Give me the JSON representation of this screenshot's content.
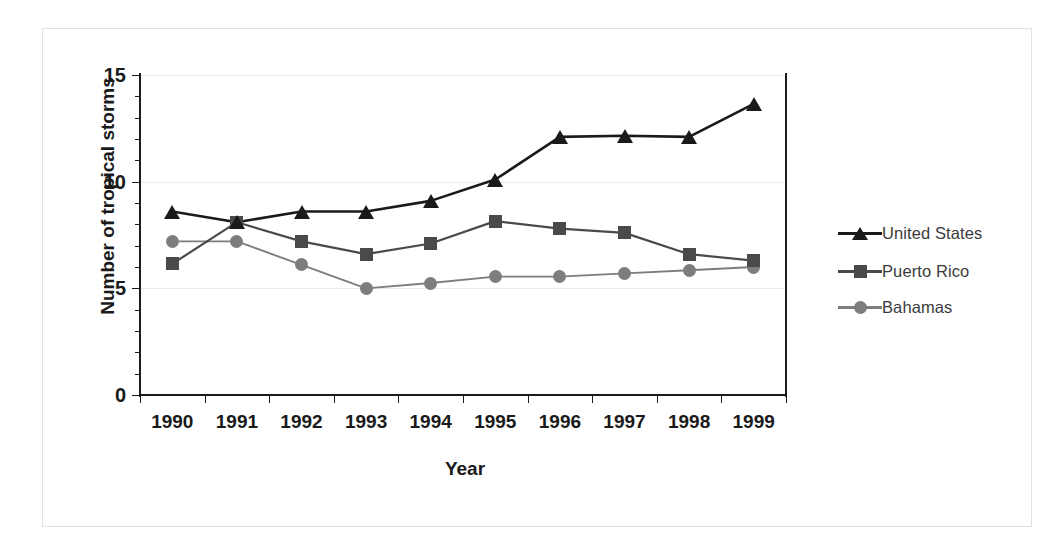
{
  "chart_data": {
    "type": "line",
    "title": "",
    "xlabel": "Year",
    "ylabel": "Number of tropical storms",
    "categories": [
      "1990",
      "1991",
      "1992",
      "1993",
      "1994",
      "1995",
      "1996",
      "1997",
      "1998",
      "1999"
    ],
    "ylim": [
      0,
      15
    ],
    "y_ticks": [
      0,
      5,
      10,
      15
    ],
    "y_tick_labels": [
      "0",
      "5",
      "10",
      "15"
    ],
    "grid": true,
    "grid_axis": "y",
    "grid_style": "dotted",
    "legend_position": "right",
    "series": [
      {
        "name": "United States",
        "marker": "triangle",
        "color": "#1a1a1a",
        "values": [
          8.6,
          8.1,
          8.6,
          8.6,
          9.1,
          10.1,
          12.1,
          12.15,
          12.1,
          13.65
        ]
      },
      {
        "name": "Puerto Rico",
        "marker": "square",
        "color": "#4a4a4a",
        "values": [
          6.15,
          8.1,
          7.2,
          6.6,
          7.1,
          8.15,
          7.8,
          7.6,
          6.6,
          6.3
        ]
      },
      {
        "name": "Bahamas",
        "marker": "circle",
        "color": "#7d7d7d",
        "values": [
          7.2,
          7.2,
          6.1,
          5.0,
          5.25,
          5.55,
          5.55,
          5.7,
          5.85,
          6.0
        ]
      }
    ]
  },
  "colors": {
    "axis": "#1a1a1a",
    "gridline": "#d8d8d8",
    "frame": "#e2e2e2",
    "legend_text": "#3b3b3b",
    "background": "#ffffff"
  },
  "legend": {
    "items": [
      {
        "label": "United States"
      },
      {
        "label": "Puerto Rico"
      },
      {
        "label": "Bahamas"
      }
    ]
  },
  "axes": {
    "x_title": "Year",
    "y_title": "Number of tropical storms"
  }
}
